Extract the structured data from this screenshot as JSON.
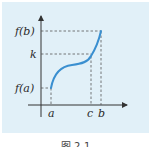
{
  "figure": {
    "labels": {
      "f_b": "f(b)",
      "k": "k",
      "f_a": "f(a)",
      "a": "a",
      "c": "c",
      "b": "b"
    },
    "caption": "图 2-1",
    "colors": {
      "background": "#e1f0f8",
      "curve": "#3a8fd0",
      "axes": "#333333",
      "dashes": "#555555"
    }
  }
}
